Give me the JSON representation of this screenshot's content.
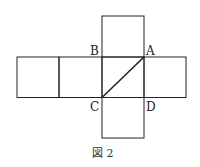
{
  "figure": {
    "caption": "図 2",
    "labels": {
      "A": "A",
      "B": "B",
      "C": "C",
      "D": "D"
    },
    "stroke_color": "#222222",
    "background": "#ffffff"
  }
}
